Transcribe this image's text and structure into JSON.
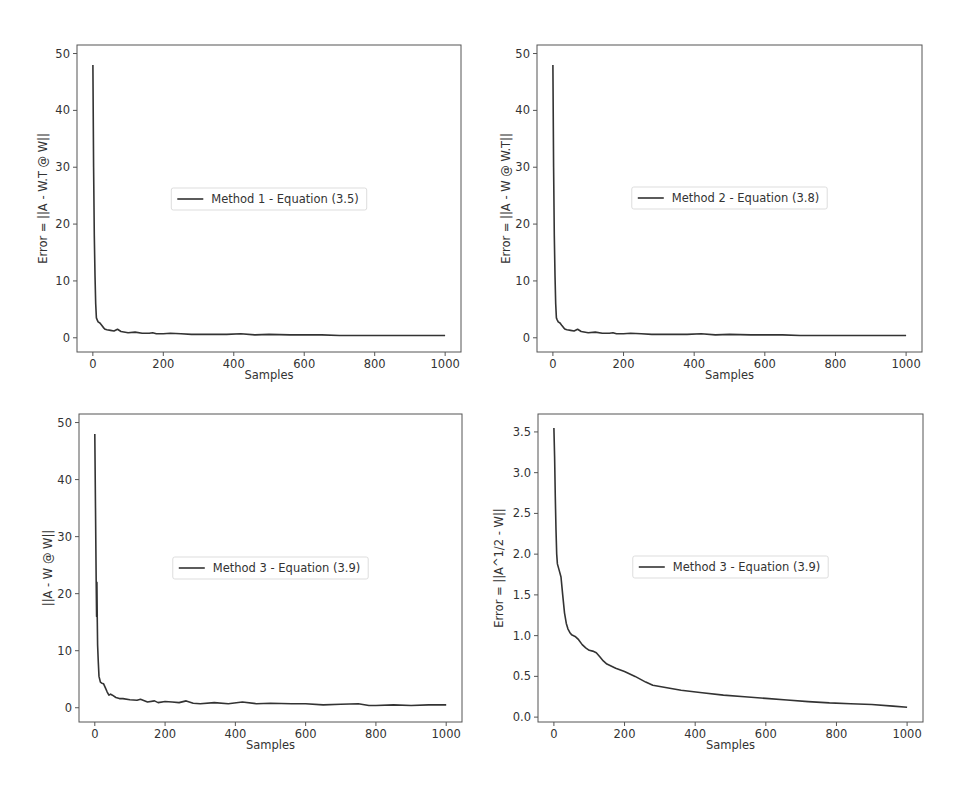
{
  "chart_data": [
    {
      "type": "line",
      "position": "top-left",
      "title": "",
      "xlabel": "Samples",
      "ylabel": "Error = ||A - W.T @ W||",
      "xlim": [
        -45,
        1045
      ],
      "ylim": [
        -2.5,
        51.5
      ],
      "xticks": [
        0,
        200,
        400,
        600,
        800,
        1000
      ],
      "yticks": [
        0,
        10,
        20,
        30,
        40,
        50
      ],
      "grid": false,
      "legend": {
        "placement": "center",
        "entries": [
          "Method 1 - Equation (3.5)"
        ]
      },
      "series": [
        {
          "name": "Method 1 - Equation (3.5)",
          "x": [
            0,
            2,
            4,
            6,
            8,
            10,
            12,
            15,
            20,
            25,
            30,
            35,
            40,
            50,
            60,
            70,
            80,
            100,
            120,
            140,
            160,
            170,
            180,
            200,
            220,
            250,
            280,
            300,
            340,
            380,
            420,
            460,
            500,
            560,
            600,
            650,
            700,
            750,
            800,
            850,
            900,
            950,
            1000
          ],
          "y": [
            48,
            30,
            18,
            11,
            6,
            3.5,
            3.2,
            2.8,
            2.6,
            2.2,
            1.8,
            1.5,
            1.4,
            1.3,
            1.2,
            1.5,
            1.1,
            0.9,
            1.0,
            0.8,
            0.8,
            0.9,
            0.7,
            0.7,
            0.8,
            0.7,
            0.6,
            0.6,
            0.6,
            0.6,
            0.7,
            0.5,
            0.6,
            0.5,
            0.5,
            0.5,
            0.4,
            0.4,
            0.4,
            0.4,
            0.4,
            0.4,
            0.4
          ]
        }
      ]
    },
    {
      "type": "line",
      "position": "top-right",
      "title": "",
      "xlabel": "Samples",
      "ylabel": "Error = ||A - W @ W.T||",
      "xlim": [
        -45,
        1045
      ],
      "ylim": [
        -2.5,
        51.5
      ],
      "xticks": [
        0,
        200,
        400,
        600,
        800,
        1000
      ],
      "yticks": [
        0,
        10,
        20,
        30,
        40,
        50
      ],
      "grid": false,
      "legend": {
        "placement": "center",
        "entries": [
          "Method 2 - Equation (3.8)"
        ]
      },
      "series": [
        {
          "name": "Method 2 - Equation (3.8)",
          "x": [
            0,
            2,
            4,
            6,
            8,
            10,
            12,
            15,
            20,
            25,
            30,
            35,
            40,
            50,
            60,
            70,
            80,
            100,
            120,
            140,
            160,
            170,
            180,
            200,
            220,
            250,
            280,
            300,
            340,
            380,
            420,
            460,
            500,
            560,
            600,
            650,
            700,
            750,
            800,
            850,
            900,
            950,
            1000
          ],
          "y": [
            48,
            30,
            18,
            11,
            6,
            3.5,
            3.2,
            2.8,
            2.6,
            2.2,
            1.8,
            1.5,
            1.4,
            1.3,
            1.2,
            1.5,
            1.1,
            0.9,
            1.0,
            0.8,
            0.8,
            0.9,
            0.7,
            0.7,
            0.8,
            0.7,
            0.6,
            0.6,
            0.6,
            0.6,
            0.7,
            0.5,
            0.6,
            0.5,
            0.5,
            0.5,
            0.4,
            0.4,
            0.4,
            0.4,
            0.4,
            0.4,
            0.4
          ]
        }
      ]
    },
    {
      "type": "line",
      "position": "bottom-left",
      "title": "",
      "xlabel": "Samples",
      "ylabel": "||A - W @ W||",
      "xlim": [
        -45,
        1045
      ],
      "ylim": [
        -2.5,
        51.5
      ],
      "xticks": [
        0,
        200,
        400,
        600,
        800,
        1000
      ],
      "yticks": [
        0,
        10,
        20,
        30,
        40,
        50
      ],
      "grid": false,
      "legend": {
        "placement": "center",
        "entries": [
          "Method 3 - Equation (3.9)"
        ]
      },
      "series": [
        {
          "name": "Method 3 - Equation (3.9)",
          "x": [
            0,
            2,
            4,
            5,
            6,
            7,
            8,
            10,
            12,
            14,
            16,
            20,
            25,
            30,
            35,
            40,
            45,
            50,
            60,
            70,
            80,
            100,
            120,
            130,
            150,
            170,
            180,
            200,
            220,
            240,
            260,
            280,
            300,
            340,
            380,
            420,
            460,
            500,
            560,
            600,
            650,
            700,
            750,
            780,
            800,
            850,
            900,
            950,
            1000
          ],
          "y": [
            48,
            35,
            22,
            16,
            22,
            15,
            11,
            8,
            5.5,
            5,
            4.5,
            4.3,
            4.2,
            3.5,
            2.8,
            2.2,
            2.4,
            2.2,
            1.8,
            1.6,
            1.6,
            1.4,
            1.3,
            1.5,
            1.0,
            1.2,
            0.9,
            1.1,
            1.0,
            0.9,
            1.2,
            0.8,
            0.7,
            0.9,
            0.7,
            1.0,
            0.7,
            0.8,
            0.7,
            0.7,
            0.5,
            0.6,
            0.7,
            0.4,
            0.4,
            0.5,
            0.4,
            0.5,
            0.5
          ]
        }
      ]
    },
    {
      "type": "line",
      "position": "bottom-right",
      "title": "",
      "xlabel": "Samples",
      "ylabel": "Error = ||A^1/2 - W||",
      "xlim": [
        -45,
        1045
      ],
      "ylim": [
        -0.06,
        3.72
      ],
      "xticks": [
        0,
        200,
        400,
        600,
        800,
        1000
      ],
      "yticks": [
        0.0,
        0.5,
        1.0,
        1.5,
        2.0,
        2.5,
        3.0,
        3.5
      ],
      "ytick_labels": [
        "0.0",
        "0.5",
        "1.0",
        "1.5",
        "2.0",
        "2.5",
        "3.0",
        "3.5"
      ],
      "grid": false,
      "legend": {
        "placement": "center",
        "entries": [
          "Method 3 - Equation (3.9)"
        ]
      },
      "series": [
        {
          "name": "Method 3 - Equation (3.9)",
          "x": [
            0,
            2,
            4,
            6,
            8,
            10,
            15,
            20,
            25,
            30,
            35,
            40,
            45,
            50,
            60,
            70,
            80,
            90,
            100,
            110,
            120,
            130,
            140,
            150,
            175,
            200,
            230,
            260,
            280,
            320,
            360,
            420,
            480,
            540,
            600,
            660,
            720,
            780,
            840,
            900,
            960,
            1000
          ],
          "y": [
            3.55,
            3.2,
            2.7,
            2.3,
            2.0,
            1.88,
            1.8,
            1.72,
            1.5,
            1.28,
            1.15,
            1.08,
            1.04,
            1.01,
            0.99,
            0.95,
            0.89,
            0.85,
            0.82,
            0.81,
            0.79,
            0.74,
            0.69,
            0.65,
            0.6,
            0.56,
            0.5,
            0.43,
            0.39,
            0.36,
            0.33,
            0.3,
            0.27,
            0.25,
            0.23,
            0.21,
            0.19,
            0.175,
            0.165,
            0.155,
            0.135,
            0.12
          ]
        }
      ]
    }
  ]
}
